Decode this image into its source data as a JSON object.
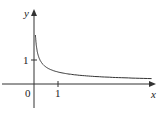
{
  "chart_data": {
    "type": "line",
    "title": "",
    "xlabel": "x",
    "ylabel": "y",
    "function": "y = 1/(2*sqrt(x)) (approx.)",
    "x": [
      0.05,
      0.1,
      0.2,
      0.3,
      0.5,
      0.75,
      1,
      1.5,
      2,
      3,
      4,
      4.9
    ],
    "values": [
      2.24,
      1.58,
      1.12,
      0.91,
      0.71,
      0.58,
      0.5,
      0.41,
      0.35,
      0.29,
      0.25,
      0.23
    ],
    "xlim": [
      -1.4,
      5.4
    ],
    "ylim": [
      -1.0,
      3.5
    ],
    "xticks": [
      "1"
    ],
    "yticks": [
      "1"
    ],
    "origin_label": "0",
    "grid": false,
    "legend": "none"
  },
  "labels": {
    "x_axis": "x",
    "y_axis": "y",
    "origin": "0",
    "x_tick": "1",
    "y_tick": "1"
  }
}
